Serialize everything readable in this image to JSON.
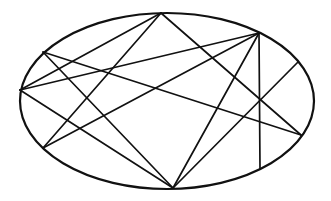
{
  "diagram": {
    "type": "ellipse-chords",
    "stroke_color": "#111111",
    "background": "#ffffff",
    "ellipse": {
      "cx": 167,
      "cy": 101,
      "rx": 147,
      "ry": 88,
      "stroke_width": 2.2
    },
    "points": {
      "top": [
        161,
        13
      ],
      "top_right": [
        259,
        33
      ],
      "right_upper": [
        298,
        62
      ],
      "right_lower": [
        301,
        135
      ],
      "bottom_right": [
        260,
        169
      ],
      "bottom": [
        173,
        188
      ],
      "lower_left": [
        43,
        148
      ],
      "left": [
        20,
        90
      ],
      "upper_left": [
        43,
        52
      ]
    },
    "chords": [
      [
        "top",
        "left"
      ],
      [
        "top",
        "lower_left"
      ],
      [
        "top",
        "right_lower"
      ],
      [
        "upper_left",
        "bottom"
      ],
      [
        "upper_left",
        "right_lower"
      ],
      [
        "left",
        "top_right"
      ],
      [
        "left",
        "bottom"
      ],
      [
        "lower_left",
        "top_right"
      ],
      [
        "top_right",
        "bottom"
      ],
      [
        "top_right",
        "bottom_right"
      ],
      [
        "right_upper",
        "bottom"
      ]
    ],
    "chord_stroke_width": 1.7
  }
}
